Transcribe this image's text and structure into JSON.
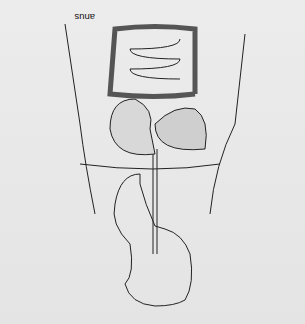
{
  "diagram": {
    "orientation": "upside-down",
    "labels_left": [
      {
        "id": "anus",
        "text": "anus"
      },
      {
        "id": "rectum",
        "text": "rectum"
      },
      {
        "id": "colon",
        "text": "colon"
      },
      {
        "id": "ileum",
        "text": "ileum"
      },
      {
        "id": "pancreas",
        "text": "pancreas"
      },
      {
        "id": "stomach",
        "text": "stomach"
      },
      {
        "id": "diaphragm",
        "text": "diaphragm"
      },
      {
        "id": "oesophagus",
        "text": "oesophagus"
      },
      {
        "id": "larynx",
        "text": "larynx"
      },
      {
        "id": "salivary_glands",
        "text": "salivary glands"
      },
      {
        "id": "mouth",
        "text": "mouth"
      },
      {
        "id": "epiglottis",
        "text": "epiglottis"
      },
      {
        "id": "hard_plate",
        "text": "hard-plate"
      }
    ],
    "labels_right": [
      {
        "id": "appendix",
        "text": "appendix"
      },
      {
        "id": "caecum",
        "text": "caecum"
      },
      {
        "id": "duodenum",
        "text": "duodenum"
      },
      {
        "id": "liver",
        "text": "liver"
      },
      {
        "id": "bile_duct",
        "text": "bile duct"
      },
      {
        "id": "gall_bladder",
        "text": "gall bladder"
      },
      {
        "id": "tongue",
        "text": "tongue"
      },
      {
        "id": "buccal_cavity",
        "text": "buccal cavity"
      },
      {
        "id": "soft_palate",
        "text": "soft palate (uvula)"
      },
      {
        "id": "salivary_gland",
        "text": "salivary gland"
      }
    ]
  }
}
